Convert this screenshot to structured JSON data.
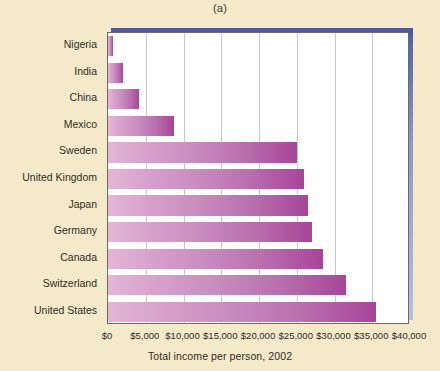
{
  "figure": {
    "panel_caption": "(a)",
    "background_color": "#f4e9c8"
  },
  "chart_data": {
    "type": "bar",
    "orientation": "horizontal",
    "title": "",
    "xlabel": "Total income per person, 2002",
    "ylabel": "",
    "categories": [
      "Nigeria",
      "India",
      "China",
      "Mexico",
      "Sweden",
      "United Kingdom",
      "Japan",
      "Germany",
      "Canada",
      "Switzerland",
      "United States"
    ],
    "values": [
      600,
      2000,
      4100,
      8800,
      25000,
      26000,
      26500,
      27000,
      28500,
      31500,
      35500
    ],
    "xlim": [
      0,
      40000
    ],
    "xticks": [
      0,
      5000,
      10000,
      15000,
      20000,
      25000,
      30000,
      35000,
      40000
    ],
    "xtick_labels": [
      "$0",
      "$5,000",
      "$10,000",
      "$15,000",
      "$20,000",
      "$25,000",
      "$30,000",
      "$35,000",
      "$40,000"
    ],
    "grid": true,
    "grid_axis": "x",
    "legend": false,
    "bar_color_start": "#e3b6d6",
    "bar_color_end": "#a8449a",
    "grid_color": "#c9c9c9",
    "plot_background": "#ffffff",
    "frame_shadow_color": "#4a56a6"
  }
}
